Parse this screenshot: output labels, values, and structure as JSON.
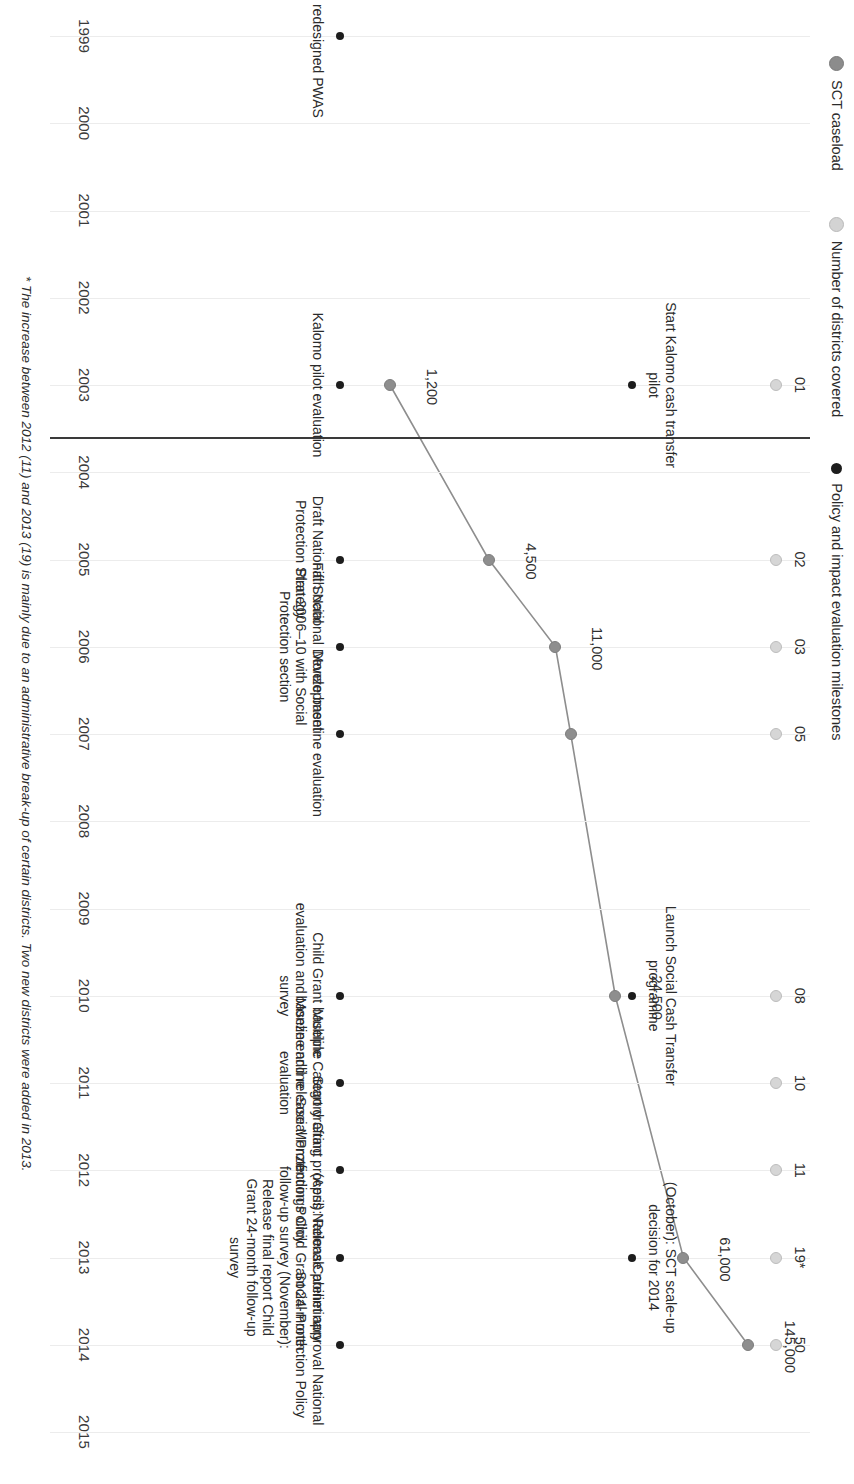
{
  "legend": {
    "items": [
      {
        "label": "SCT caseload",
        "marker": "caseload",
        "color": "#8e8e8e"
      },
      {
        "label": "Number of districts covered",
        "marker": "districts",
        "color": "#d6d6d6"
      },
      {
        "label": "Policy and impact evaluation milestones",
        "marker": "milestone",
        "color": "#1d1d1d"
      }
    ]
  },
  "footnote": {
    "text": "* The increase between 2012 (11) and 2013 (19) is mainly due to an administrative break-up of certain districts. Two new districts were added in 2013."
  },
  "chart_data": {
    "type": "line",
    "title": "",
    "xlabel": "",
    "ylabel": "",
    "grid": true,
    "legend_position": "top-left",
    "categories": [
      "1999",
      "2000",
      "2001",
      "2002",
      "2003",
      "2004",
      "2005",
      "2006",
      "2007",
      "2008",
      "2009",
      "2010",
      "2011",
      "2012",
      "2013",
      "2014",
      "2015"
    ],
    "series": [
      {
        "name": "SCT caseload",
        "points": [
          {
            "year": "2003",
            "value": 1200,
            "label": "1,200"
          },
          {
            "year": "2005",
            "value": 4500,
            "label": "4,500"
          },
          {
            "year": "2006",
            "value": 11000,
            "label": "11,000"
          },
          {
            "year": "2007",
            "value": 13500,
            "label": ""
          },
          {
            "year": "2010",
            "value": 24500,
            "label": "24,500"
          },
          {
            "year": "2013",
            "value": 61000,
            "label": "61,000"
          },
          {
            "year": "2014",
            "value": 145000,
            "label": "145,000"
          }
        ]
      },
      {
        "name": "Number of districts covered",
        "points": [
          {
            "year": "2003",
            "value": 1,
            "label": "01"
          },
          {
            "year": "2005",
            "value": 2,
            "label": "02"
          },
          {
            "year": "2006",
            "value": 3,
            "label": "03"
          },
          {
            "year": "2007",
            "value": 5,
            "label": "05"
          },
          {
            "year": "2010",
            "value": 8,
            "label": "08"
          },
          {
            "year": "2011",
            "value": 10,
            "label": "10"
          },
          {
            "year": "2012",
            "value": 11,
            "label": "11"
          },
          {
            "year": "2013",
            "value": 19,
            "label": "19*"
          },
          {
            "year": "2014",
            "value": 50,
            "label": "50"
          }
        ]
      }
    ],
    "milestones_programme": [
      {
        "year": "2003",
        "text": "Start Kalomo cash transfer pilot"
      },
      {
        "year": "2010",
        "text": "Launch Social Cash Transfer programme"
      },
      {
        "year": "2013",
        "text": "(October): SCT scale-up decision for 2014"
      }
    ],
    "milestones_policy": [
      {
        "year": "1999",
        "text": "Launch redesigned PWAS"
      },
      {
        "year": "2003",
        "text": "Kalomo pilot evaluation"
      },
      {
        "year": "2005",
        "text": "Draft National Social Protection Strategy"
      },
      {
        "year": "2006",
        "text": "Fifth National Development Plan 2006–10 with Social Protection section"
      },
      {
        "year": "2007",
        "text": "Monze baseline evaluation"
      },
      {
        "year": "2010",
        "text": "Child Grant baseline evaluation and Monze endline survey"
      },
      {
        "year": "2011",
        "text": "Multiple Category Grant baseline and release Monze evaluation"
      },
      {
        "year": "2012",
        "text": "Start drafting process National Social Protection Policy"
      },
      {
        "year": "2013",
        "text": "(April): Release preliminary findings Child Grant 24-month follow-up survey\n\n(November): Release final report Child Grant 24-month follow-up survey"
      },
      {
        "year": "2014",
        "text": "Cabinet approval National Social Protection Policy"
      }
    ]
  }
}
